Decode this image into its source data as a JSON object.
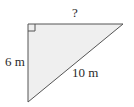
{
  "diagram": {
    "type": "right-triangle",
    "fill_color": "#efefef",
    "stroke_color": "#555555",
    "vertices": {
      "right_angle": [
        28,
        24
      ],
      "top_right": [
        123,
        24
      ],
      "bottom": [
        28,
        102
      ]
    },
    "labels": {
      "top_side": "?",
      "left_side": "6 m",
      "hypotenuse": "10 m"
    },
    "right_angle_marker": true
  }
}
